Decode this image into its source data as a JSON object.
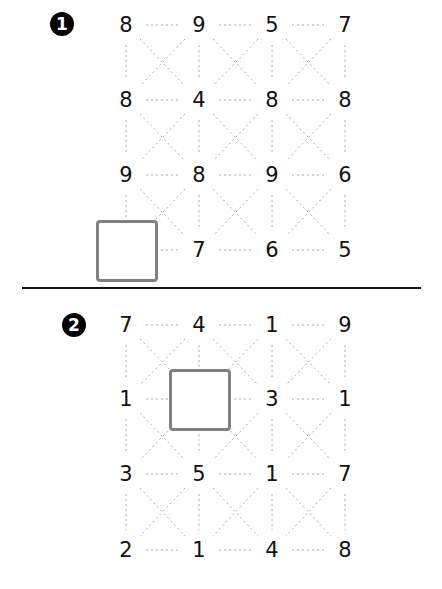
{
  "puzzles": [
    {
      "marker": "1",
      "marker_icon": "number-one-circle-icon",
      "grid": [
        [
          "8",
          "9",
          "5",
          "7"
        ],
        [
          "8",
          "4",
          "8",
          "8"
        ],
        [
          "9",
          "8",
          "9",
          "6"
        ],
        [
          "",
          "7",
          "6",
          "5"
        ]
      ],
      "blank_cell": {
        "row": 3,
        "col": 0
      }
    },
    {
      "marker": "2",
      "marker_icon": "number-two-circle-icon",
      "grid": [
        [
          "7",
          "4",
          "1",
          "9"
        ],
        [
          "1",
          "",
          "3",
          "1"
        ],
        [
          "3",
          "5",
          "1",
          "7"
        ],
        [
          "2",
          "1",
          "4",
          "8"
        ]
      ],
      "blank_cell": {
        "row": 1,
        "col": 1
      }
    }
  ],
  "colors": {
    "text": "#111111",
    "dotted_line": "#aaaaaa",
    "blank_border": "#808080",
    "divider": "#111111"
  }
}
